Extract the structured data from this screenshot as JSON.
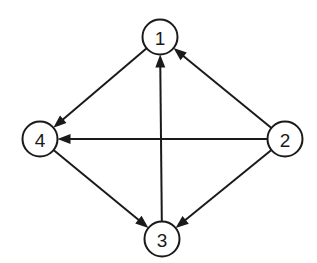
{
  "title": "",
  "nodes": [
    {
      "id": "1",
      "label": "1"
    },
    {
      "id": "2",
      "label": "2"
    },
    {
      "id": "3",
      "label": "3"
    },
    {
      "id": "4",
      "label": "4"
    }
  ],
  "edges": [
    {
      "from": "1",
      "to": "4"
    },
    {
      "from": "2",
      "to": "1"
    },
    {
      "from": "2",
      "to": "4"
    },
    {
      "from": "3",
      "to": "1"
    },
    {
      "from": "4",
      "to": "3"
    },
    {
      "from": "2",
      "to": "3"
    }
  ],
  "colors": {
    "stroke": "#1a1a1a",
    "background": "#ffffff"
  }
}
